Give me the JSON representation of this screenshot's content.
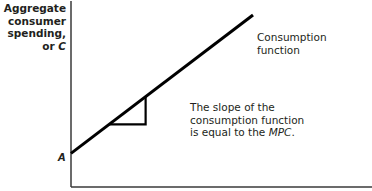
{
  "chart_data": {
    "type": "line",
    "title": "",
    "ylabel_lines": [
      "Aggregate",
      "consumer",
      "spending, or"
    ],
    "ylabel_symbol": "C",
    "xlabel": "",
    "intercept_label": "A",
    "series": [
      {
        "name": "Consumption function",
        "label_lines": [
          "Consumption",
          "function"
        ],
        "x": [
          0,
          1
        ],
        "y": [
          0.18,
          0.92
        ]
      }
    ],
    "slope_triangle": {
      "x_start": 0.21,
      "x_end": 0.41
    },
    "annotation_lines": [
      "The slope of the",
      "consumption function",
      "is equal to the"
    ],
    "annotation_italic": "MPC",
    "annotation_end": ".",
    "xlim": [
      0,
      1
    ],
    "ylim": [
      0,
      1
    ],
    "grid": false
  },
  "colors": {
    "ink": "#231f20",
    "axis": "#3a3a3a"
  }
}
